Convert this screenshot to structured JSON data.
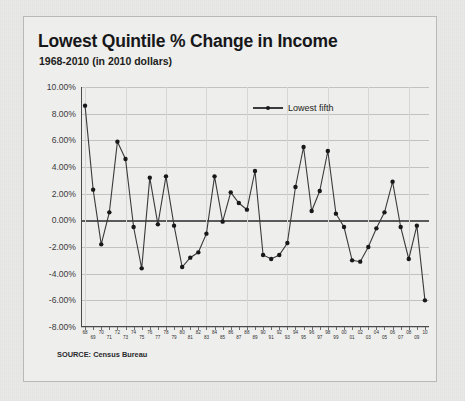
{
  "card": {
    "title": "Lowest Quintile % Change in Income",
    "subtitle": "1968-2010 (in 2010 dollars)",
    "source": "SOURCE: Census Bureau"
  },
  "colors": {
    "page_background": "#e9e9e7",
    "card_background": "#eeeeec",
    "card_border": "#b9b9b6",
    "series_line": "#3a3a3c",
    "marker": "#18181a",
    "gridline": "#c2c2c0",
    "zero_line": "#5a5a5c",
    "axis": "#4a4a4c"
  },
  "chart_data": {
    "type": "line",
    "title": "Lowest Quintile % Change in Income",
    "subtitle": "1968-2010 (in 2010 dollars)",
    "xlabel": "",
    "ylabel": "",
    "ylim": [
      -8,
      10
    ],
    "ytick_step": 2,
    "ytick_labels": [
      "10.00%",
      "8.00%",
      "6.00%",
      "4.00%",
      "2.00%",
      "0.00%",
      "-2.00%",
      "-4.00%",
      "-6.00%",
      "-8.00%"
    ],
    "ytick_values": [
      10,
      8,
      6,
      4,
      2,
      0,
      -2,
      -4,
      -6,
      -8
    ],
    "grid": true,
    "zero_line": true,
    "legend": [
      "Lowest fifth"
    ],
    "legend_position": "top-center",
    "categories": [
      "68",
      "69",
      "70",
      "71",
      "72",
      "73",
      "74",
      "75",
      "76",
      "77",
      "78",
      "79",
      "80",
      "81",
      "82",
      "83",
      "84",
      "85",
      "86",
      "87",
      "88",
      "89",
      "90",
      "91",
      "92",
      "93",
      "94",
      "95",
      "96",
      "97",
      "98",
      "99",
      "00",
      "01",
      "02",
      "03",
      "04",
      "05",
      "06",
      "07",
      "08",
      "09",
      "10"
    ],
    "series": [
      {
        "name": "Lowest fifth",
        "values": [
          8.6,
          2.3,
          -1.8,
          0.6,
          5.9,
          4.6,
          -0.5,
          -3.6,
          3.2,
          -0.3,
          3.3,
          -0.4,
          -3.5,
          -2.8,
          -2.4,
          -1.0,
          3.3,
          -0.1,
          2.1,
          1.3,
          0.8,
          3.7,
          -2.6,
          -2.9,
          -2.6,
          -1.7,
          2.5,
          5.5,
          0.7,
          2.2,
          5.2,
          0.5,
          -0.5,
          -3.0,
          -3.1,
          -2.0,
          -0.6,
          0.6,
          2.9,
          -0.5,
          -2.9,
          -0.4,
          -6.0
        ]
      }
    ]
  },
  "xaxis": {
    "alt_row_labels": [
      "13",
      "56",
      "18",
      "14",
      "17",
      "19",
      "20",
      "21",
      "22",
      "23",
      "25",
      "29",
      "30",
      "36"
    ]
  }
}
